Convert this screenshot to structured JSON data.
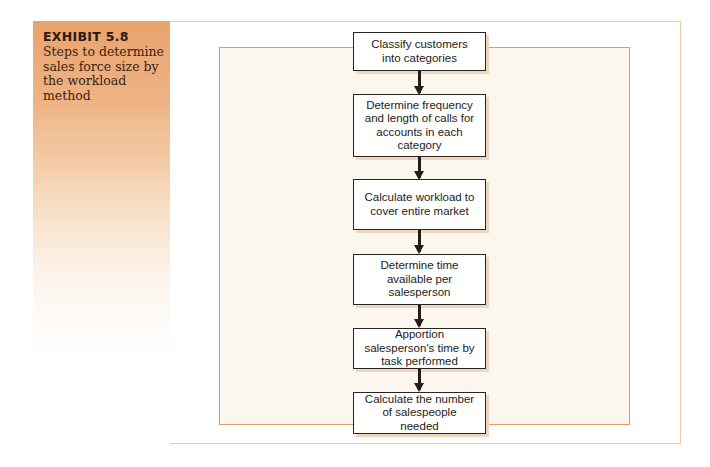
{
  "exhibit": {
    "number": "EXHIBIT 5.8",
    "caption": "Steps to determine sales force size by the workload method"
  },
  "flow": {
    "steps": [
      {
        "label": "Classify customers into categories"
      },
      {
        "label": "Determine frequency and length of calls for accounts in each category"
      },
      {
        "label": "Calculate workload to cover entire market"
      },
      {
        "label": "Determine time available per salesperson"
      },
      {
        "label": "Apportion salesperson's time by task performed"
      },
      {
        "label": "Calculate the number of salespeople needed"
      }
    ]
  },
  "colors": {
    "accent_orange": "#e59a60",
    "side_panel_top": "#e9a36b",
    "inner_bg": "#fbf6ee",
    "box_border": "#2b2320"
  }
}
